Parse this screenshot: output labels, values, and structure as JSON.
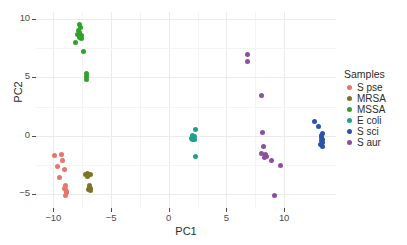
{
  "chart_data": {
    "type": "scatter",
    "title": "",
    "xlabel": "PC1",
    "ylabel": "PC2",
    "xlim": [
      -11.5,
      14.5
    ],
    "ylim": [
      -6.2,
      10.6
    ],
    "xticks": [
      "-10",
      "-5",
      "0",
      "5",
      "10"
    ],
    "xtick_values": [
      -10,
      -5,
      0,
      5,
      10
    ],
    "yticks": [
      "10",
      "5",
      "0",
      "-5"
    ],
    "ytick_values": [
      10,
      5,
      0,
      -5
    ],
    "grid": true,
    "legend_position": "right",
    "legend_title": "Samples",
    "series": [
      {
        "name": "S pse",
        "color": "#e8756a",
        "points": [
          [
            -9.9,
            -1.7
          ],
          [
            -9.3,
            -1.6
          ],
          [
            -9.6,
            -2.6
          ],
          [
            -9.2,
            -2.1
          ],
          [
            -9.5,
            -3.6
          ],
          [
            -9.0,
            -2.9
          ],
          [
            -8.95,
            -4.3
          ],
          [
            -8.95,
            -4.6
          ],
          [
            -8.9,
            -4.9
          ],
          [
            -8.95,
            -5.1
          ],
          [
            -9.0,
            -4.5
          ],
          [
            -8.9,
            -4.75
          ]
        ]
      },
      {
        "name": "MRSA",
        "color": "#7d7524",
        "points": [
          [
            -7.2,
            -3.3
          ],
          [
            -7.0,
            -3.2
          ],
          [
            -6.8,
            -3.3
          ],
          [
            -7.05,
            -3.5
          ],
          [
            -6.9,
            -4.3
          ],
          [
            -6.8,
            -4.5
          ],
          [
            -6.95,
            -4.65
          ],
          [
            -6.75,
            -4.7
          ],
          [
            -6.85,
            -4.4
          ]
        ]
      },
      {
        "name": "MSSA",
        "color": "#33a02c",
        "points": [
          [
            -7.75,
            9.5
          ],
          [
            -7.65,
            9.3
          ],
          [
            -7.85,
            9.0
          ],
          [
            -7.7,
            8.85
          ],
          [
            -7.9,
            8.7
          ],
          [
            -7.6,
            8.6
          ],
          [
            -7.75,
            8.45
          ],
          [
            -7.55,
            8.35
          ],
          [
            -8.1,
            8.0
          ],
          [
            -7.35,
            7.2
          ],
          [
            -7.1,
            5.3
          ],
          [
            -7.1,
            5.1
          ],
          [
            -7.1,
            4.85
          ]
        ]
      },
      {
        "name": "E coli",
        "color": "#1fa08a",
        "points": [
          [
            2.3,
            0.5
          ],
          [
            2.1,
            0.05
          ],
          [
            2.2,
            -0.1
          ],
          [
            1.95,
            -0.25
          ],
          [
            2.25,
            -0.3
          ],
          [
            2.1,
            -0.35
          ],
          [
            2.3,
            -1.75
          ]
        ]
      },
      {
        "name": "S sci",
        "color": "#2b54a8",
        "points": [
          [
            12.6,
            1.25
          ],
          [
            13.0,
            0.75
          ],
          [
            13.3,
            0.15
          ],
          [
            13.25,
            0.0
          ],
          [
            13.2,
            -0.15
          ],
          [
            13.35,
            -0.3
          ],
          [
            13.2,
            -0.45
          ],
          [
            13.3,
            -0.6
          ],
          [
            13.15,
            -0.75
          ],
          [
            13.3,
            -0.9
          ]
        ]
      },
      {
        "name": "S aur",
        "color": "#8d4f9e",
        "points": [
          [
            6.8,
            7.0
          ],
          [
            6.85,
            6.4
          ],
          [
            8.0,
            3.45
          ],
          [
            8.1,
            0.3
          ],
          [
            8.2,
            -0.95
          ],
          [
            8.0,
            -1.55
          ],
          [
            8.35,
            -1.6
          ],
          [
            8.5,
            -1.75
          ],
          [
            8.3,
            -1.85
          ],
          [
            8.9,
            -2.1
          ],
          [
            9.7,
            -2.55
          ],
          [
            9.15,
            -5.15
          ]
        ]
      }
    ]
  }
}
